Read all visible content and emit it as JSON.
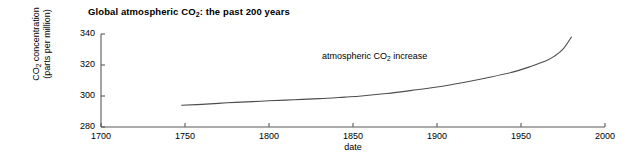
{
  "chart_data": {
    "type": "line",
    "title": "Global atmospheric CO2: the past 200 years",
    "title_parts": {
      "pre": "Global atmospheric CO",
      "sub": "2",
      "post": ": the past 200 years"
    },
    "xlabel": "date",
    "ylabel": "CO2 concentration (parts per million)",
    "ylabel_line1_pre": "CO",
    "ylabel_line1_sub": "2",
    "ylabel_line1_post": " concentration",
    "ylabel_line2": "(parts per million)",
    "xlim": [
      1700,
      2000
    ],
    "ylim": [
      280,
      340
    ],
    "xticks": [
      1700,
      1750,
      1800,
      1850,
      1900,
      1950,
      2000
    ],
    "xtick_labels": [
      "1700",
      "1750",
      "1800",
      "1850",
      "1900",
      "1950",
      "2000"
    ],
    "yticks": [
      280,
      300,
      320,
      340
    ],
    "ytick_labels": [
      "280",
      "300",
      "320",
      "340"
    ],
    "grid": false,
    "legend": null,
    "annotations": [
      {
        "text": "atmospheric CO2 increase",
        "text_pre": "atmospheric CO",
        "text_sub": "2",
        "text_post": " increase",
        "x": 1832,
        "y": 317
      }
    ],
    "series": [
      {
        "name": "atmospheric CO2 increase",
        "color": "#4d4d4d",
        "x": [
          1748,
          1760,
          1775,
          1790,
          1800,
          1815,
          1830,
          1845,
          1855,
          1870,
          1885,
          1900,
          1915,
          1930,
          1945,
          1955,
          1965,
          1970,
          1975,
          1980
        ],
        "y": [
          294.0,
          294.6,
          295.6,
          296.4,
          296.9,
          297.6,
          298.3,
          299.3,
          300.0,
          301.6,
          303.6,
          305.8,
          308.6,
          311.8,
          315.4,
          318.8,
          322.7,
          325.8,
          330.2,
          338.0
        ]
      }
    ]
  },
  "axis": {
    "line_color": "#595959",
    "text_color": "#000000"
  }
}
